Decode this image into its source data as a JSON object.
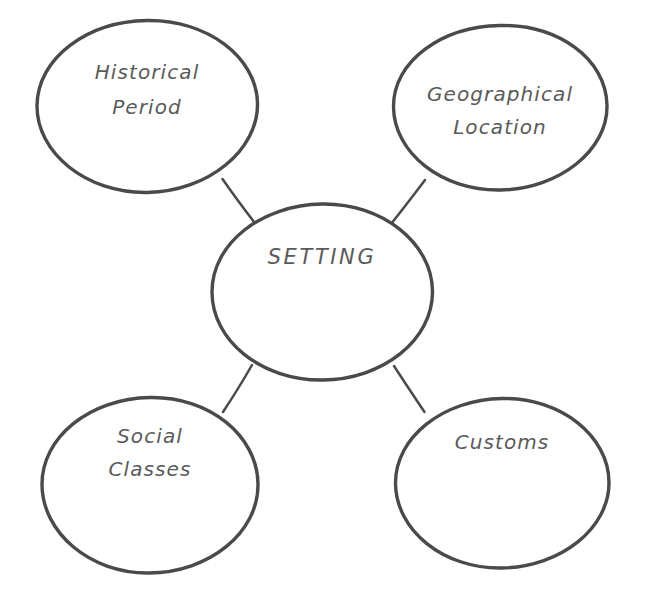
{
  "diagram": {
    "type": "concept-map",
    "title": "SETTING",
    "background_color": "#ffffff",
    "stroke_color": "#4a4a4a",
    "text_color": "#5a5a5a",
    "center": {
      "id": "setting",
      "label": "SETTING",
      "shape": "ellipse",
      "cx": 322,
      "cy": 292,
      "rx": 110,
      "ry": 88,
      "label_x": 322,
      "label_y": 258
    },
    "nodes": [
      {
        "id": "historical-period",
        "label_line1": "Historical",
        "label_line2": "Period",
        "shape": "ellipse",
        "cx": 147,
        "cy": 106,
        "rx": 110,
        "ry": 86,
        "label_x": 147,
        "label_y": 73,
        "label2_y": 108
      },
      {
        "id": "geographical-location",
        "label_line1": "Geographical",
        "label_line2": "Location",
        "shape": "ellipse",
        "cx": 500,
        "cy": 107,
        "rx": 107,
        "ry": 82,
        "label_x": 500,
        "label_y": 95,
        "label2_y": 128
      },
      {
        "id": "social-classes",
        "label_line1": "Social",
        "label_line2": "Classes",
        "shape": "ellipse",
        "cx": 150,
        "cy": 485,
        "rx": 108,
        "ry": 88,
        "label_x": 150,
        "label_y": 437,
        "label2_y": 470
      },
      {
        "id": "customs",
        "label_line1": "Customs",
        "label_line2": "",
        "shape": "ellipse",
        "cx": 502,
        "cy": 483,
        "rx": 107,
        "ry": 85,
        "label_x": 502,
        "label_y": 443,
        "label2_y": 0
      }
    ],
    "connectors": [
      {
        "id": "setting-to-historical-period",
        "from": "setting",
        "to": "historical-period",
        "x1": 222,
        "y1": 179,
        "x2": 254,
        "y2": 222
      },
      {
        "id": "setting-to-geographical-location",
        "from": "setting",
        "to": "geographical-location",
        "x1": 425,
        "y1": 180,
        "x2": 391,
        "y2": 224
      },
      {
        "id": "setting-to-social-classes",
        "from": "setting",
        "to": "social-classes",
        "x1": 252,
        "y1": 365,
        "x2": 223,
        "y2": 412
      },
      {
        "id": "setting-to-customs",
        "from": "setting",
        "to": "customs",
        "x1": 394,
        "y1": 366,
        "x2": 424,
        "y2": 412
      }
    ]
  }
}
